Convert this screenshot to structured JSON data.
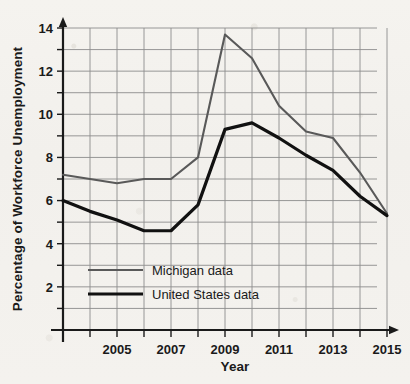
{
  "chart_data": {
    "type": "line",
    "title": "",
    "xlabel": "Year",
    "ylabel": "Percentage of Workforce Unemployment",
    "x": [
      2003,
      2004,
      2005,
      2006,
      2007,
      2008,
      2009,
      2010,
      2011,
      2012,
      2013,
      2014,
      2015
    ],
    "xlim": [
      2003,
      2015
    ],
    "ylim": [
      0,
      14
    ],
    "x_tick_labels": [
      "2005",
      "2007",
      "2009",
      "2011",
      "2013",
      "2015"
    ],
    "x_tick_values": [
      2005,
      2007,
      2009,
      2011,
      2013,
      2015
    ],
    "x_minor_tick_values": [
      2004,
      2006,
      2008,
      2010,
      2012,
      2014
    ],
    "y_tick_labels": [
      "2",
      "4",
      "6",
      "8",
      "10",
      "12",
      "14"
    ],
    "y_tick_values": [
      2,
      4,
      6,
      8,
      10,
      12,
      14
    ],
    "y_gridline_values": [
      1,
      2,
      3,
      4,
      5,
      6,
      7,
      8,
      9,
      10,
      11,
      12,
      13,
      14
    ],
    "grid": true,
    "legend_position": "lower-left-inside",
    "series": [
      {
        "name": "Michigan data",
        "color": "#595959",
        "width": 2.1,
        "values": [
          7.2,
          7.0,
          6.8,
          7.0,
          7.0,
          8.0,
          13.7,
          12.6,
          10.4,
          9.2,
          8.9,
          7.3,
          5.4
        ]
      },
      {
        "name": "United States data",
        "color": "#111111",
        "width": 3.2,
        "values": [
          6.0,
          5.5,
          5.1,
          4.6,
          4.6,
          5.8,
          9.3,
          9.6,
          8.9,
          8.1,
          7.4,
          6.2,
          5.3
        ]
      }
    ]
  },
  "legend": {
    "items": [
      {
        "label": "Michigan data"
      },
      {
        "label": "United States data"
      }
    ]
  },
  "axes": {
    "x_title": "Year",
    "y_title": "Percentage of Workforce Unemployment"
  },
  "colors": {
    "michigan": "#595959",
    "united_states": "#111111",
    "grid": "#8c8c8c",
    "axis": "#1a1a1a",
    "background": "#f4f2ee"
  }
}
